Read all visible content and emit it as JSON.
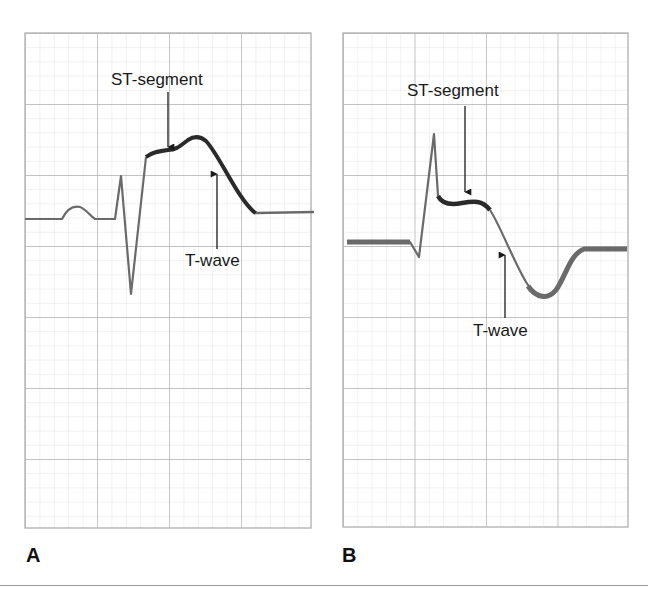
{
  "figure": {
    "colors": {
      "minor_grid": "#dcdcdc",
      "major_grid": "#b4b4b4",
      "trace": "#6a6a6a",
      "trace_highlight": "#2a2a2a",
      "text": "#1a1a1a"
    },
    "panels": [
      {
        "id": "A",
        "label": "A",
        "annotations": {
          "st_segment": "ST-segment",
          "t_wave": "T-wave"
        },
        "description": "ST-segment elevation"
      },
      {
        "id": "B",
        "label": "B",
        "annotations": {
          "st_segment": "ST-segment",
          "t_wave": "T-wave"
        },
        "description": "ST-segment elevation with inverted T-wave"
      }
    ]
  }
}
